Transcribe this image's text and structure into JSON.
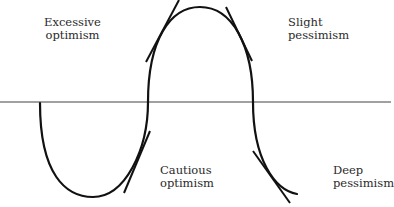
{
  "diagram": {
    "type": "cycle-sentiment-curve",
    "baseline": {
      "color": "#808080"
    },
    "curve": {
      "color": "#111111"
    },
    "labels": [
      {
        "id": "excessive-optimism",
        "line1": "Excessive",
        "line2": "optimism"
      },
      {
        "id": "slight-pessimism",
        "line1": "Slight",
        "line2": "pessimism"
      },
      {
        "id": "cautious-optimism",
        "line1": "Cautious",
        "line2": "optimism"
      },
      {
        "id": "deep-pessimism",
        "line1": "Deep",
        "line2": "pessimism"
      }
    ]
  }
}
